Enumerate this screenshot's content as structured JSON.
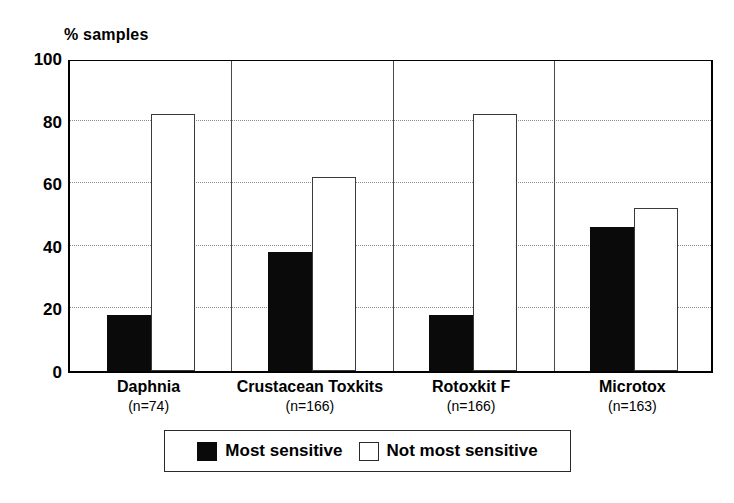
{
  "chart_data": {
    "type": "bar",
    "title": "",
    "ylabel": "% samples",
    "xlabel": "",
    "ylim": [
      0,
      100
    ],
    "yticks": [
      0,
      20,
      40,
      60,
      80,
      100
    ],
    "grid": "horizontal-dotted",
    "legend_position": "bottom-center",
    "categories": [
      "Daphnia",
      "Crustacean Toxkits",
      "Rotoxkit F",
      "Microtox"
    ],
    "category_counts": [
      "(n=74)",
      "(n=166)",
      "(n=166)",
      "(n=163)"
    ],
    "series": [
      {
        "name": "Most sensitive",
        "color": "#0a0a0a",
        "values": [
          18,
          38,
          18,
          46
        ]
      },
      {
        "name": "Not most sensitive",
        "color": "#ffffff",
        "values": [
          82,
          62,
          82,
          52
        ]
      }
    ]
  },
  "axis": {
    "y_title": "% samples",
    "y_tick_labels": [
      "100",
      "80",
      "60",
      "40",
      "20",
      "0"
    ]
  },
  "groups": [
    {
      "name": "Daphnia",
      "count": "(n=74)",
      "dark": 18,
      "light": 82
    },
    {
      "name": "Crustacean Toxkits",
      "count": "(n=166)",
      "dark": 38,
      "light": 62
    },
    {
      "name": "Rotoxkit F",
      "count": "(n=166)",
      "dark": 18,
      "light": 82
    },
    {
      "name": "Microtox",
      "count": "(n=163)",
      "dark": 46,
      "light": 52
    }
  ],
  "legend": {
    "items": [
      {
        "label": "Most sensitive",
        "swatch": "dark"
      },
      {
        "label": "Not most sensitive",
        "swatch": "light"
      }
    ]
  },
  "colors": {
    "dark_bar": "#0a0a0a",
    "light_bar": "#ffffff",
    "axis": "#000000",
    "gridline": "#8a8a8a"
  }
}
